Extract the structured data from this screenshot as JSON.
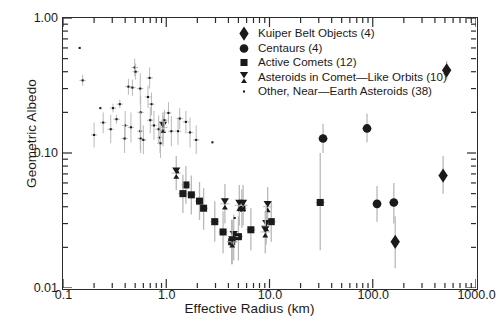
{
  "chart_data": {
    "type": "scatter",
    "title": "",
    "xlabel": "Effective Radius (km)",
    "ylabel": "Geometric Albedo",
    "xscale": "log",
    "yscale": "log",
    "xlim": [
      0.1,
      1000.0
    ],
    "ylim": [
      0.01,
      1.0
    ],
    "grid": false,
    "legend_position": "top-center-right",
    "xticks": [
      "0.1",
      "1.0",
      "10.0",
      "1000.0"
    ],
    "xtick_values": [
      0.1,
      1.0,
      10.0,
      1000.0
    ],
    "xticks_all": [
      "0.1",
      "1.0",
      "10.0",
      "100.0",
      "1000.0"
    ],
    "xtick_values_all": [
      0.1,
      1.0,
      10.0,
      100.0,
      1000.0
    ],
    "yticks": [
      "1.00",
      "0.10",
      "0.01"
    ],
    "ytick_values": [
      1.0,
      0.1,
      0.01
    ],
    "series": [
      {
        "name": "Kuiper Belt Objects (4)",
        "count": 4,
        "marker": "diamond",
        "color": "#1a1a1a",
        "points": [
          {
            "x": 1200.0,
            "y": 0.56,
            "yerr_lo": 0.47,
            "yerr_hi": 0.66
          },
          {
            "x": 520.0,
            "y": 0.41,
            "yerr_lo": 0.35,
            "yerr_hi": 0.48
          },
          {
            "x": 480.0,
            "y": 0.068,
            "yerr_lo": 0.05,
            "yerr_hi": 0.095
          },
          {
            "x": 165.0,
            "y": 0.022,
            "yerr_lo": 0.014,
            "yerr_hi": 0.034
          }
        ]
      },
      {
        "name": "Centaurs (4)",
        "count": 4,
        "marker": "circle",
        "color": "#1a1a1a",
        "points": [
          {
            "x": 33.0,
            "y": 0.128,
            "yerr_lo": 0.1,
            "yerr_hi": 0.165
          },
          {
            "x": 88.0,
            "y": 0.152,
            "yerr_lo": 0.12,
            "yerr_hi": 0.195
          },
          {
            "x": 110.0,
            "y": 0.042,
            "yerr_lo": 0.031,
            "yerr_hi": 0.057
          },
          {
            "x": 160.0,
            "y": 0.043,
            "yerr_lo": 0.03,
            "yerr_hi": 0.06
          }
        ]
      },
      {
        "name": "Active Comets (12)",
        "count": 12,
        "marker": "square",
        "color": "#1a1a1a",
        "points": [
          {
            "x": 1.55,
            "y": 0.058,
            "yerr_lo": 0.042,
            "yerr_hi": 0.08
          },
          {
            "x": 1.45,
            "y": 0.05,
            "yerr_lo": 0.036,
            "yerr_hi": 0.069
          },
          {
            "x": 1.75,
            "y": 0.049,
            "yerr_lo": 0.035,
            "yerr_hi": 0.068
          },
          {
            "x": 2.1,
            "y": 0.044,
            "yerr_lo": 0.032,
            "yerr_hi": 0.061
          },
          {
            "x": 2.3,
            "y": 0.039,
            "yerr_lo": 0.027,
            "yerr_hi": 0.055
          },
          {
            "x": 2.95,
            "y": 0.031,
            "yerr_lo": 0.022,
            "yerr_hi": 0.044
          },
          {
            "x": 3.55,
            "y": 0.026,
            "yerr_lo": 0.018,
            "yerr_hi": 0.037
          },
          {
            "x": 4.3,
            "y": 0.022,
            "yerr_lo": 0.015,
            "yerr_hi": 0.032
          },
          {
            "x": 5.4,
            "y": 0.039,
            "yerr_lo": 0.028,
            "yerr_hi": 0.054
          },
          {
            "x": 5.0,
            "y": 0.024,
            "yerr_lo": 0.016,
            "yerr_hi": 0.034
          },
          {
            "x": 6.6,
            "y": 0.027,
            "yerr_lo": 0.019,
            "yerr_hi": 0.039
          },
          {
            "x": 10.4,
            "y": 0.031,
            "yerr_lo": 0.022,
            "yerr_hi": 0.044
          },
          {
            "x": 31.0,
            "y": 0.043,
            "yerr_lo": 0.019,
            "yerr_hi": 0.1
          }
        ]
      },
      {
        "name": "Asteroids in Comet—Like Orbits (10)",
        "count": 10,
        "marker": "bowtie",
        "color": "#1a1a1a",
        "points": [
          {
            "x": 0.93,
            "y": 0.155,
            "yerr_lo": 0.12,
            "yerr_hi": 0.2
          },
          {
            "x": 1.25,
            "y": 0.071,
            "yerr_lo": 0.053,
            "yerr_hi": 0.095
          },
          {
            "x": 3.7,
            "y": 0.042,
            "yerr_lo": 0.03,
            "yerr_hi": 0.059
          },
          {
            "x": 5.1,
            "y": 0.041,
            "yerr_lo": 0.029,
            "yerr_hi": 0.058
          },
          {
            "x": 5.55,
            "y": 0.041,
            "yerr_lo": 0.029,
            "yerr_hi": 0.058
          },
          {
            "x": 4.5,
            "y": 0.024,
            "yerr_lo": 0.016,
            "yerr_hi": 0.035
          },
          {
            "x": 4.35,
            "y": 0.022,
            "yerr_lo": 0.015,
            "yerr_hi": 0.032
          },
          {
            "x": 9.6,
            "y": 0.04,
            "yerr_lo": 0.029,
            "yerr_hi": 0.056
          },
          {
            "x": 9.3,
            "y": 0.029,
            "yerr_lo": 0.021,
            "yerr_hi": 0.041
          },
          {
            "x": 9.1,
            "y": 0.026,
            "yerr_lo": 0.018,
            "yerr_hi": 0.037
          }
        ]
      },
      {
        "name": "Other, Near—Earth Asteroids (38)",
        "count": 38,
        "marker": "dot",
        "color": "#1a1a1a",
        "points": [
          {
            "x": 0.145,
            "y": 0.6,
            "yerr_lo": 0.6,
            "yerr_hi": 0.6
          },
          {
            "x": 0.155,
            "y": 0.345,
            "yerr_lo": 0.315,
            "yerr_hi": 0.38
          },
          {
            "x": 0.305,
            "y": 0.215,
            "yerr_lo": 0.2,
            "yerr_hi": 0.232
          },
          {
            "x": 0.355,
            "y": 0.23,
            "yerr_lo": 0.215,
            "yerr_hi": 0.248
          },
          {
            "x": 0.33,
            "y": 0.178,
            "yerr_lo": 0.165,
            "yerr_hi": 0.192
          },
          {
            "x": 0.495,
            "y": 0.43,
            "yerr_lo": 0.37,
            "yerr_hi": 0.5
          },
          {
            "x": 0.505,
            "y": 0.4,
            "yerr_lo": 0.35,
            "yerr_hi": 0.46
          },
          {
            "x": 0.43,
            "y": 0.31,
            "yerr_lo": 0.27,
            "yerr_hi": 0.355
          },
          {
            "x": 0.47,
            "y": 0.305,
            "yerr_lo": 0.265,
            "yerr_hi": 0.35
          },
          {
            "x": 0.56,
            "y": 0.3,
            "yerr_lo": 0.23,
            "yerr_hi": 0.39
          },
          {
            "x": 0.565,
            "y": 0.2,
            "yerr_lo": 0.15,
            "yerr_hi": 0.265
          },
          {
            "x": 0.4,
            "y": 0.16,
            "yerr_lo": 0.125,
            "yerr_hi": 0.205
          },
          {
            "x": 0.455,
            "y": 0.155,
            "yerr_lo": 0.12,
            "yerr_hi": 0.2
          },
          {
            "x": 0.56,
            "y": 0.145,
            "yerr_lo": 0.105,
            "yerr_hi": 0.2
          },
          {
            "x": 0.395,
            "y": 0.128,
            "yerr_lo": 0.1,
            "yerr_hi": 0.165
          },
          {
            "x": 0.565,
            "y": 0.128,
            "yerr_lo": 0.1,
            "yerr_hi": 0.165
          },
          {
            "x": 0.29,
            "y": 0.15,
            "yerr_lo": 0.118,
            "yerr_hi": 0.192
          },
          {
            "x": 0.245,
            "y": 0.168,
            "yerr_lo": 0.14,
            "yerr_hi": 0.2
          },
          {
            "x": 0.69,
            "y": 0.36,
            "yerr_lo": 0.3,
            "yerr_hi": 0.43
          },
          {
            "x": 0.665,
            "y": 0.26,
            "yerr_lo": 0.215,
            "yerr_hi": 0.315
          },
          {
            "x": 0.72,
            "y": 0.23,
            "yerr_lo": 0.19,
            "yerr_hi": 0.28
          },
          {
            "x": 0.7,
            "y": 0.175,
            "yerr_lo": 0.14,
            "yerr_hi": 0.22
          },
          {
            "x": 0.76,
            "y": 0.16,
            "yerr_lo": 0.125,
            "yerr_hi": 0.205
          },
          {
            "x": 0.845,
            "y": 0.15,
            "yerr_lo": 0.118,
            "yerr_hi": 0.19
          },
          {
            "x": 0.93,
            "y": 0.145,
            "yerr_lo": 0.112,
            "yerr_hi": 0.188
          },
          {
            "x": 0.87,
            "y": 0.13,
            "yerr_lo": 0.1,
            "yerr_hi": 0.168
          },
          {
            "x": 0.96,
            "y": 0.175,
            "yerr_lo": 0.145,
            "yerr_hi": 0.21
          },
          {
            "x": 1.05,
            "y": 0.198,
            "yerr_lo": 0.165,
            "yerr_hi": 0.238
          },
          {
            "x": 1.12,
            "y": 0.145,
            "yerr_lo": 0.112,
            "yerr_hi": 0.188
          },
          {
            "x": 1.35,
            "y": 0.18,
            "yerr_lo": 0.15,
            "yerr_hi": 0.215
          },
          {
            "x": 1.55,
            "y": 0.17,
            "yerr_lo": 0.14,
            "yerr_hi": 0.205
          },
          {
            "x": 1.3,
            "y": 0.145,
            "yerr_lo": 0.115,
            "yerr_hi": 0.183
          },
          {
            "x": 1.7,
            "y": 0.142,
            "yerr_lo": 0.11,
            "yerr_hi": 0.183
          },
          {
            "x": 1.95,
            "y": 0.125,
            "yerr_lo": 0.098,
            "yerr_hi": 0.16
          },
          {
            "x": 0.2,
            "y": 0.136,
            "yerr_lo": 0.11,
            "yerr_hi": 0.168
          },
          {
            "x": 0.6,
            "y": 0.125,
            "yerr_lo": 0.098,
            "yerr_hi": 0.16
          },
          {
            "x": 0.88,
            "y": 0.118,
            "yerr_lo": 0.092,
            "yerr_hi": 0.152
          },
          {
            "x": 1.3,
            "y": 0.072,
            "yerr_lo": 0.072,
            "yerr_hi": 0.072
          },
          {
            "x": 2.8,
            "y": 0.12,
            "yerr_lo": 0.12,
            "yerr_hi": 0.12
          },
          {
            "x": 4.6,
            "y": 0.033,
            "yerr_lo": 0.033,
            "yerr_hi": 0.033
          },
          {
            "x": 0.23,
            "y": 0.215,
            "yerr_lo": 0.215,
            "yerr_hi": 0.215
          }
        ]
      }
    ]
  },
  "legend": {
    "items": [
      {
        "label": "Kuiper Belt Objects (4)",
        "marker": "diamond"
      },
      {
        "label": "Centaurs (4)",
        "marker": "circle"
      },
      {
        "label": "Active Comets (12)",
        "marker": "square"
      },
      {
        "label": "Asteroids in Comet—Like Orbits (10)",
        "marker": "bowtie"
      },
      {
        "label": "Other, Near—Earth Asteroids (38)",
        "marker": "dot"
      }
    ]
  },
  "axes": {
    "x_title": "Effective Radius (km)",
    "y_title": "Geometric Albedo",
    "x_tick_labels": [
      "0.1",
      "1.0",
      "10.0",
      "100.0",
      "1000.0"
    ],
    "y_tick_labels": [
      "1.00",
      "0.10",
      "0.01"
    ]
  },
  "colors": {
    "marker": "#1a1a1a",
    "errorbar": "#b9b9b9",
    "frame": "#2b2b2b",
    "text": "#1a1a1a",
    "background": "#ffffff"
  }
}
